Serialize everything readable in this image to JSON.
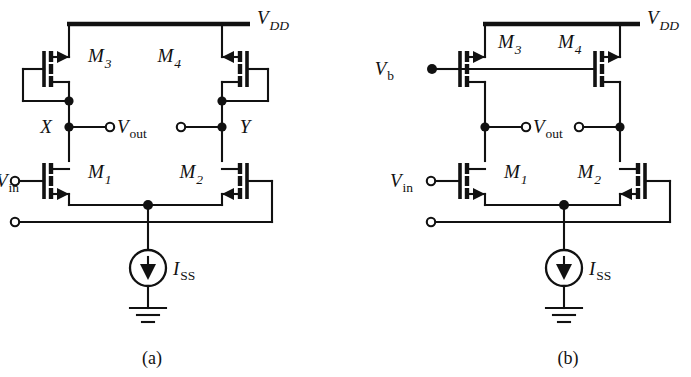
{
  "figure": {
    "type": "circuit-schematic",
    "background_color": "#ffffff",
    "line_color": "#111111"
  },
  "circuits": [
    {
      "id": "a",
      "caption": "(a)",
      "supply_label": {
        "base": "V",
        "sub": "DD"
      },
      "bias_label": null,
      "input_label": {
        "base": "V",
        "sub": "in"
      },
      "output_label": {
        "base": "V",
        "sub": "out"
      },
      "tail_source_label": {
        "base": "I",
        "sub": "SS"
      },
      "node_labels": [
        "X",
        "Y"
      ],
      "transistors": [
        {
          "name": "M",
          "sub": "1",
          "kind": "NMOS",
          "mirrored": false
        },
        {
          "name": "M",
          "sub": "2",
          "kind": "NMOS",
          "mirrored": true
        },
        {
          "name": "M",
          "sub": "3",
          "kind": "PMOS",
          "mirrored": false,
          "diode_connected": true
        },
        {
          "name": "M",
          "sub": "4",
          "kind": "PMOS",
          "mirrored": true,
          "diode_connected": true
        }
      ],
      "ground_symbol": true
    },
    {
      "id": "b",
      "caption": "(b)",
      "supply_label": {
        "base": "V",
        "sub": "DD"
      },
      "bias_label": {
        "base": "V",
        "sub": "b"
      },
      "input_label": {
        "base": "V",
        "sub": "in"
      },
      "output_label": {
        "base": "V",
        "sub": "out"
      },
      "tail_source_label": {
        "base": "I",
        "sub": "SS"
      },
      "node_labels": [],
      "transistors": [
        {
          "name": "M",
          "sub": "1",
          "kind": "NMOS",
          "mirrored": false
        },
        {
          "name": "M",
          "sub": "2",
          "kind": "NMOS",
          "mirrored": true
        },
        {
          "name": "M",
          "sub": "3",
          "kind": "PMOS",
          "mirrored": false,
          "diode_connected": false
        },
        {
          "name": "M",
          "sub": "4",
          "kind": "PMOS",
          "mirrored": false,
          "diode_connected": false
        }
      ],
      "ground_symbol": true
    }
  ],
  "labels": {
    "a_vdd_base": "V",
    "a_vdd_sub": "DD",
    "a_m3_base": "M",
    "a_m3_sub": "3",
    "a_m4_base": "M",
    "a_m4_sub": "4",
    "a_nodeX": "X",
    "a_nodeY": "Y",
    "a_vout_base": "V",
    "a_vout_sub": "out",
    "a_vin_base": "V",
    "a_vin_sub": "in",
    "a_m1_base": "M",
    "a_m1_sub": "1",
    "a_m2_base": "M",
    "a_m2_sub": "2",
    "a_iss_base": "I",
    "a_iss_sub": "SS",
    "a_caption": "(a)",
    "b_vdd_base": "V",
    "b_vdd_sub": "DD",
    "b_m3_base": "M",
    "b_m3_sub": "3",
    "b_m4_base": "M",
    "b_m4_sub": "4",
    "b_vb_base": "V",
    "b_vb_sub": "b",
    "b_vout_base": "V",
    "b_vout_sub": "out",
    "b_vin_base": "V",
    "b_vin_sub": "in",
    "b_m1_base": "M",
    "b_m1_sub": "1",
    "b_m2_base": "M",
    "b_m2_sub": "2",
    "b_iss_base": "I",
    "b_iss_sub": "SS",
    "b_caption": "(b)"
  }
}
